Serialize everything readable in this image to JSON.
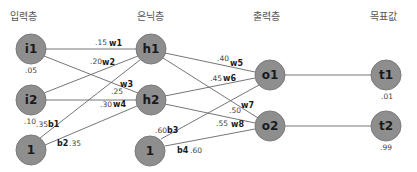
{
  "diagram": {
    "layers": [
      {
        "id": "input",
        "title": "입력층"
      },
      {
        "id": "hidden",
        "title": "은닉층"
      },
      {
        "id": "output",
        "title": "출력층"
      },
      {
        "id": "target",
        "title": "목표값"
      }
    ],
    "nodes": [
      {
        "id": "i1",
        "label": "i1",
        "layer": "input",
        "value": ".05"
      },
      {
        "id": "i2",
        "label": "i2",
        "layer": "input",
        "value": ".10"
      },
      {
        "id": "b_in",
        "label": "1",
        "layer": "input",
        "value": ""
      },
      {
        "id": "h1",
        "label": "h1",
        "layer": "hidden",
        "value": ""
      },
      {
        "id": "h2",
        "label": "h2",
        "layer": "hidden",
        "value": ""
      },
      {
        "id": "b_hid",
        "label": "1",
        "layer": "hidden",
        "value": ""
      },
      {
        "id": "o1",
        "label": "o1",
        "layer": "output",
        "value": ""
      },
      {
        "id": "o2",
        "label": "o2",
        "layer": "output",
        "value": ""
      },
      {
        "id": "t1",
        "label": "t1",
        "layer": "target",
        "value": ".01"
      },
      {
        "id": "t2",
        "label": "t2",
        "layer": "target",
        "value": ".99"
      }
    ],
    "edges": [
      {
        "from": "i1",
        "to": "h1",
        "name": "w1",
        "weight": ".15"
      },
      {
        "from": "i2",
        "to": "h1",
        "name": "w2",
        "weight": ".20"
      },
      {
        "from": "i1",
        "to": "h2",
        "name": "w3",
        "weight": ".25"
      },
      {
        "from": "i2",
        "to": "h2",
        "name": "w4",
        "weight": ".30"
      },
      {
        "from": "b_in",
        "to": "h1",
        "name": "b1",
        "weight": ".35"
      },
      {
        "from": "b_in",
        "to": "h2",
        "name": "b2",
        "weight": ".35"
      },
      {
        "from": "h1",
        "to": "o1",
        "name": "w5",
        "weight": ".40"
      },
      {
        "from": "h2",
        "to": "o1",
        "name": "w6",
        "weight": ".45"
      },
      {
        "from": "h1",
        "to": "o2",
        "name": "w7",
        "weight": ".50"
      },
      {
        "from": "h2",
        "to": "o2",
        "name": "w8",
        "weight": ".55"
      },
      {
        "from": "b_hid",
        "to": "o1",
        "name": "b3",
        "weight": ".60"
      },
      {
        "from": "b_hid",
        "to": "o2",
        "name": "b4",
        "weight": ".60"
      },
      {
        "from": "o1",
        "to": "t1",
        "name": "",
        "weight": ""
      },
      {
        "from": "o2",
        "to": "t2",
        "name": "",
        "weight": ""
      }
    ]
  }
}
